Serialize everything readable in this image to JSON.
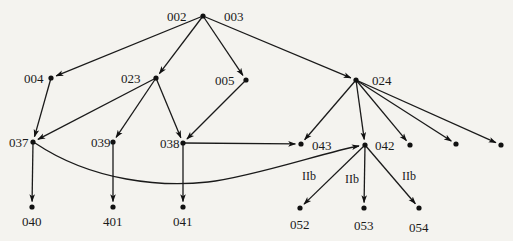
{
  "diagram": {
    "type": "directed-graph",
    "nodes": [
      {
        "id": "n002",
        "label": "002",
        "x": 203,
        "y": 16,
        "lx": 167,
        "ly": 21
      },
      {
        "id": "n003",
        "label": "003",
        "x": 203,
        "y": 16,
        "lx": 224,
        "ly": 21
      },
      {
        "id": "n004",
        "label": "004",
        "x": 51,
        "y": 78,
        "lx": 24,
        "ly": 83
      },
      {
        "id": "n023",
        "label": "023",
        "x": 156,
        "y": 78,
        "lx": 121,
        "ly": 83
      },
      {
        "id": "n005",
        "label": "005",
        "x": 246,
        "y": 80,
        "lx": 215,
        "ly": 85
      },
      {
        "id": "n024",
        "label": "024",
        "x": 356,
        "y": 80,
        "lx": 372,
        "ly": 85
      },
      {
        "id": "n037",
        "label": "037",
        "x": 33,
        "y": 142,
        "lx": 9,
        "ly": 147
      },
      {
        "id": "n039",
        "label": "039",
        "x": 113,
        "y": 142,
        "lx": 91,
        "ly": 147
      },
      {
        "id": "n038",
        "label": "038",
        "x": 183,
        "y": 143,
        "lx": 160,
        "ly": 148
      },
      {
        "id": "n043",
        "label": "043",
        "x": 301,
        "y": 144,
        "lx": 312,
        "ly": 150
      },
      {
        "id": "n042",
        "label": "042",
        "x": 365,
        "y": 145,
        "lx": 375,
        "ly": 150
      },
      {
        "id": "u1",
        "label": "",
        "x": 410,
        "y": 145
      },
      {
        "id": "u2",
        "label": "",
        "x": 456,
        "y": 144
      },
      {
        "id": "u3",
        "label": "",
        "x": 501,
        "y": 145
      },
      {
        "id": "n040",
        "label": "040",
        "x": 32,
        "y": 207,
        "lx": 22,
        "ly": 226
      },
      {
        "id": "n401",
        "label": "401",
        "x": 113,
        "y": 207,
        "lx": 103,
        "ly": 226
      },
      {
        "id": "n041",
        "label": "041",
        "x": 183,
        "y": 207,
        "lx": 173,
        "ly": 226
      },
      {
        "id": "n052",
        "label": "052",
        "x": 300,
        "y": 208,
        "lx": 290,
        "ly": 229
      },
      {
        "id": "n053",
        "label": "053",
        "x": 364,
        "y": 208,
        "lx": 354,
        "ly": 230
      },
      {
        "id": "n054",
        "label": "054",
        "x": 419,
        "y": 208,
        "lx": 409,
        "ly": 232
      }
    ],
    "edges": [
      {
        "from": "n002",
        "to": "n004"
      },
      {
        "from": "n002",
        "to": "n023"
      },
      {
        "from": "n002",
        "to": "n005"
      },
      {
        "from": "n002",
        "to": "n024"
      },
      {
        "from": "n004",
        "to": "n037"
      },
      {
        "from": "n023",
        "to": "n037"
      },
      {
        "from": "n023",
        "to": "n039"
      },
      {
        "from": "n023",
        "to": "n038"
      },
      {
        "from": "n005",
        "to": "n038"
      },
      {
        "from": "n024",
        "to": "n043"
      },
      {
        "from": "n024",
        "to": "n042"
      },
      {
        "from": "n024",
        "to": "u1"
      },
      {
        "from": "n024",
        "to": "u2"
      },
      {
        "from": "n024",
        "to": "u3"
      },
      {
        "from": "n038",
        "to": "n043"
      },
      {
        "from": "n037",
        "to": "n040"
      },
      {
        "from": "n039",
        "to": "n401"
      },
      {
        "from": "n038",
        "to": "n041"
      },
      {
        "from": "n037",
        "to": "n042",
        "curved": true
      },
      {
        "from": "n042",
        "to": "n052",
        "label": "IIb",
        "lx": 302,
        "ly": 180
      },
      {
        "from": "n042",
        "to": "n053",
        "label": "IIb",
        "lx": 345,
        "ly": 183
      },
      {
        "from": "n042",
        "to": "n054",
        "label": "IIb",
        "lx": 402,
        "ly": 180
      }
    ]
  }
}
